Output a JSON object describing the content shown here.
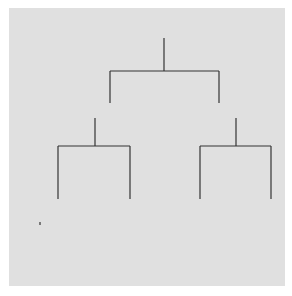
{
  "diagram": {
    "type": "kinship-chart",
    "colors": {
      "background": "#e0e0e0",
      "line": "#333333",
      "filled": "#8c8c8c",
      "unfilled": "#ffffff"
    },
    "individuals": [
      {
        "id": "1",
        "label": "1",
        "sex": "male",
        "shaded": false
      },
      {
        "id": "2",
        "label": "2",
        "sex": "female",
        "shaded": true
      },
      {
        "id": "3",
        "label": "3",
        "sex": "female",
        "shaded": false
      },
      {
        "id": "4",
        "label": "4",
        "sex": "male",
        "shaded": true
      },
      {
        "id": "5",
        "label": "5",
        "sex": "female",
        "shaded": true
      },
      {
        "id": "6",
        "label": "6",
        "sex": "male",
        "shaded": false
      },
      {
        "id": "7",
        "label": "7",
        "sex": "female",
        "shaded": false
      },
      {
        "id": "8",
        "label": "8",
        "sex": "male",
        "shaded": false
      },
      {
        "id": "9",
        "label": "9",
        "sex": "male",
        "shaded": false
      },
      {
        "id": "10",
        "label": "10",
        "sex": "female",
        "shaded": false
      },
      {
        "id": "11",
        "label": "11",
        "sex": "female",
        "shaded": false
      },
      {
        "id": "12",
        "label": "12",
        "sex": "male",
        "shaded": true
      },
      {
        "id": "13",
        "label": "13",
        "sex": "male",
        "shaded": false
      },
      {
        "id": "14",
        "label": "14",
        "sex": "female",
        "shaded": true
      },
      {
        "id": "15",
        "label": "15",
        "sex": "male",
        "shaded": false
      },
      {
        "id": "16",
        "label": "16",
        "sex": "female",
        "shaded": false
      },
      {
        "id": "17",
        "label": "17",
        "sex": "male",
        "shaded": false
      },
      {
        "id": "18",
        "label": "18",
        "sex": "female",
        "shaded": false
      },
      {
        "id": "19",
        "label": "19",
        "sex": "male",
        "shaded": false
      },
      {
        "id": "20",
        "label": "20",
        "sex": "female",
        "shaded": false
      },
      {
        "id": "21",
        "label": "21",
        "sex": "male",
        "shaded": true
      },
      {
        "id": "22",
        "label": "22",
        "sex": "female",
        "shaded": true
      }
    ],
    "marriages": [
      {
        "spouses": [
          "1",
          "2"
        ],
        "symbol": "="
      },
      {
        "spouses": [
          "3",
          "4"
        ],
        "symbol": "="
      },
      {
        "spouses": [
          "5",
          "6"
        ],
        "symbol": "="
      },
      {
        "spouses": [
          "7",
          "8"
        ],
        "symbol": "="
      },
      {
        "spouses": [
          "9",
          "10"
        ],
        "symbol": "="
      },
      {
        "spouses": [
          "11",
          "12"
        ],
        "symbol": "="
      },
      {
        "spouses": [
          "13",
          "14"
        ],
        "symbol": "="
      }
    ],
    "descent": [
      {
        "parents": [
          "1",
          "2"
        ],
        "children": [
          "4",
          "5"
        ]
      },
      {
        "parents": [
          "3",
          "4"
        ],
        "children": [
          "8",
          "10"
        ]
      },
      {
        "parents": [
          "5",
          "6"
        ],
        "children": [
          "12",
          "14"
        ]
      },
      {
        "parents": [
          "7",
          "8"
        ],
        "children": [
          "15",
          "16"
        ]
      },
      {
        "parents": [
          "9",
          "10"
        ],
        "children": [
          "17",
          "18"
        ]
      },
      {
        "parents": [
          "11",
          "12"
        ],
        "children": [
          "19",
          "20"
        ]
      },
      {
        "parents": [
          "13",
          "14"
        ],
        "children": [
          "21",
          "22"
        ]
      }
    ],
    "legend_note": "triangle = male, circle = female, shaded = member of traced line"
  }
}
